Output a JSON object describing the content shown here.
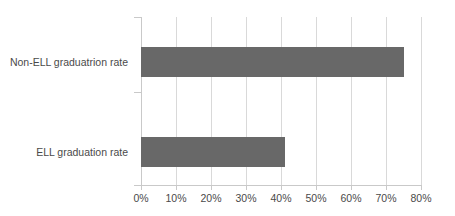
{
  "chart_data": {
    "type": "bar",
    "orientation": "horizontal",
    "title": "",
    "xlabel": "",
    "ylabel": "",
    "categories": [
      "Non-ELL graduatrion rate",
      "ELL graduation rate"
    ],
    "values": [
      75,
      41
    ],
    "value_suffix": "%",
    "xlim": [
      0,
      80
    ],
    "xticks": [
      0,
      10,
      20,
      30,
      40,
      50,
      60,
      70,
      80
    ],
    "xtick_labels": [
      "0%",
      "10%",
      "20%",
      "30%",
      "40%",
      "50%",
      "60%",
      "70%",
      "80%"
    ],
    "grid": true,
    "grid_axis": "x",
    "legend": false,
    "legend_position": "none",
    "series": [
      {
        "name": "Graduation rate",
        "values": [
          75,
          41
        ]
      }
    ]
  },
  "style": {
    "bar_color": "#686868",
    "gridline_color": "#d9d9d9",
    "axis_color": "#c9c9c9",
    "text_color": "#4a4a4a",
    "background_color": "#ffffff"
  }
}
